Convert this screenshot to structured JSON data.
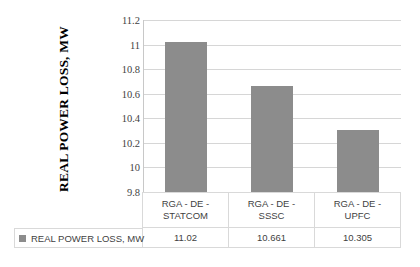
{
  "chart_data": {
    "type": "bar",
    "title": "",
    "xlabel": "",
    "ylabel": "REAL POWER LOSS, MW",
    "ylim": [
      9.8,
      11.2
    ],
    "grid": true,
    "legend_position": "bottom-table",
    "categories": [
      "RGA - DE - STATCOM",
      "RGA - DE - SSSC",
      "RGA - DE - UPFC"
    ],
    "category_lines": [
      [
        "RGA - DE -",
        "STATCOM"
      ],
      [
        "RGA - DE -",
        "SSSC"
      ],
      [
        "RGA - DE -",
        "UPFC"
      ]
    ],
    "series": [
      {
        "name": "REAL POWER LOSS, MW",
        "values": [
          11.02,
          10.661,
          10.305
        ],
        "value_labels": [
          "11.02",
          "10.661",
          "10.305"
        ],
        "color": "#8c8c8c"
      }
    ],
    "ytick_labels": [
      "11.2",
      "11",
      "10.8",
      "10.6",
      "10.4",
      "10.2",
      "10",
      "9.8"
    ],
    "ytick_values": [
      11.2,
      11,
      10.8,
      10.6,
      10.4,
      10.2,
      10,
      9.8
    ]
  },
  "legend": {
    "label": "REAL POWER LOSS, MW",
    "swatch_color": "#8c8c8c",
    "marker_icon": "square-marker-icon"
  },
  "axis": {
    "title": "REAL POWER LOSS, MW"
  },
  "colors": {
    "bar": "#8c8c8c",
    "gridline": "#d6d6d6",
    "table_border": "#d9d9d9",
    "text": "#3f3f3f",
    "background": "#ffffff"
  }
}
